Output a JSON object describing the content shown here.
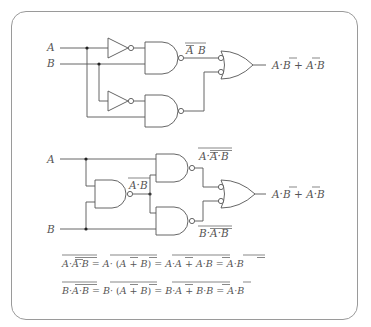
{
  "diagram": {
    "type": "logic-circuit-figure",
    "circuit_top": {
      "inputs": [
        "A",
        "B"
      ],
      "gates": [
        {
          "type": "NOT",
          "input": "A"
        },
        {
          "type": "NAND",
          "inputs": [
            "NOT A",
            "B"
          ],
          "output_label": "A B",
          "output_label_overlines": [
            "A"
          ]
        },
        {
          "type": "NOT",
          "input": "B"
        },
        {
          "type": "NAND",
          "inputs": [
            "NOT B",
            "A"
          ]
        },
        {
          "type": "OR",
          "inverted_inputs": true
        }
      ],
      "output_label": "A·B + A·B",
      "output_parts": [
        "A",
        "·",
        "B",
        " + ",
        "A",
        "·",
        "B"
      ]
    },
    "circuit_bottom": {
      "inputs": [
        "A",
        "B"
      ],
      "gates": [
        {
          "type": "NAND",
          "inputs": [
            "A",
            "B"
          ],
          "output_label": "A·B"
        },
        {
          "type": "NAND",
          "inputs": [
            "A",
            "NAND(A,B)"
          ],
          "output_label": "A·A·B"
        },
        {
          "type": "NAND",
          "inputs": [
            "NAND(A,B)",
            "B"
          ],
          "output_label": "B·A·B"
        },
        {
          "type": "OR",
          "inverted_inputs": true
        }
      ],
      "output_label": "A·B + A·B"
    },
    "labels": {
      "a": "A",
      "b": "B",
      "dot": "·",
      "plus": "+",
      "eq": "=",
      "lparen": "(",
      "rparen": ")"
    },
    "equations": [
      "A·A·B = A·(A+B) = A·A + A·B = A·B",
      "B·A·B = B·(A+B) = B·A + B·B = A·B"
    ]
  },
  "colors": {
    "line": "#555555",
    "frame": "#9a9a9a",
    "background": "#ffffff"
  }
}
